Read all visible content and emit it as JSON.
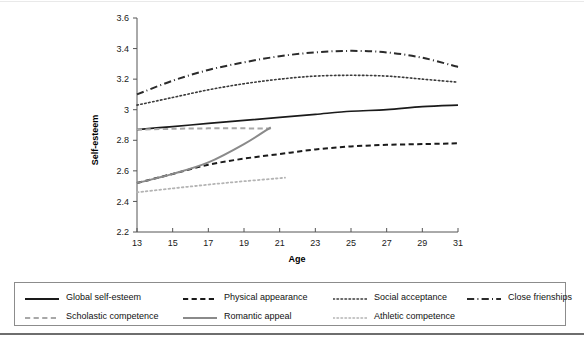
{
  "figure": {
    "has_top_rule": true,
    "has_bottom_rule": true
  },
  "chart_data": {
    "type": "line",
    "title": "",
    "xlabel": "Age",
    "ylabel": "Self-esteem",
    "xlim": [
      13,
      31
    ],
    "ylim": [
      2.2,
      3.6
    ],
    "xticks": [
      13,
      15,
      17,
      19,
      21,
      23,
      25,
      27,
      29,
      31
    ],
    "xtick_labels": [
      "13",
      "15",
      "17",
      "19",
      "21",
      "23",
      "25",
      "27",
      "29",
      "31"
    ],
    "yticks": [
      2.2,
      2.4,
      2.6,
      2.8,
      3.0,
      3.2,
      3.4,
      3.6
    ],
    "ytick_labels": [
      "2.2",
      "2.4",
      "2.6",
      "2.8",
      "3",
      "3.2",
      "3.4",
      "3.6"
    ],
    "grid": false,
    "legend_position": "below",
    "series": [
      {
        "name": "Global self-esteem",
        "style": "solid",
        "color": "#1a1a1a",
        "width": 1.7,
        "x": [
          13,
          15,
          17,
          19,
          21,
          23,
          25,
          27,
          29,
          31
        ],
        "values": [
          2.87,
          2.89,
          2.91,
          2.93,
          2.95,
          2.97,
          2.99,
          3.0,
          3.02,
          3.03
        ]
      },
      {
        "name": "Physical appearance",
        "style": "dashed",
        "color": "#1a1a1a",
        "width": 2.0,
        "x": [
          13,
          15,
          17,
          19,
          21,
          23,
          25,
          27,
          29,
          31
        ],
        "values": [
          2.52,
          2.58,
          2.64,
          2.68,
          2.71,
          2.74,
          2.76,
          2.77,
          2.775,
          2.78
        ]
      },
      {
        "name": "Social acceptance",
        "style": "dotted",
        "color": "#3a3a3a",
        "width": 1.6,
        "x": [
          13,
          15,
          17,
          19,
          21,
          23,
          25,
          27,
          29,
          31
        ],
        "values": [
          3.03,
          3.08,
          3.13,
          3.17,
          3.2,
          3.22,
          3.225,
          3.22,
          3.2,
          3.18
        ]
      },
      {
        "name": "Close frienships",
        "style": "dashdot",
        "color": "#2b2b2b",
        "width": 2.0,
        "x": [
          13,
          15,
          17,
          19,
          21,
          23,
          25,
          27,
          29,
          31
        ],
        "values": [
          3.1,
          3.19,
          3.26,
          3.31,
          3.35,
          3.375,
          3.385,
          3.375,
          3.34,
          3.28
        ]
      },
      {
        "name": "Scholastic competence",
        "style": "dashed",
        "color": "#a8a8a8",
        "width": 2.0,
        "x": [
          13,
          15,
          17,
          19,
          20.5
        ],
        "values": [
          2.87,
          2.875,
          2.878,
          2.878,
          2.877
        ]
      },
      {
        "name": "Romantic appeal",
        "style": "solid",
        "color": "#8a8a8a",
        "width": 2.0,
        "x": [
          13,
          15,
          17,
          19,
          20.5
        ],
        "values": [
          2.52,
          2.58,
          2.655,
          2.775,
          2.885
        ]
      },
      {
        "name": "Athletic competence",
        "style": "dotted",
        "color": "#b4b4b4",
        "width": 1.8,
        "x": [
          13,
          15,
          17,
          19,
          21.3
        ],
        "values": [
          2.46,
          2.485,
          2.51,
          2.532,
          2.555
        ]
      }
    ]
  },
  "legend": {
    "entries": [
      {
        "label": "Global self-esteem",
        "style": "solid",
        "color": "#1a1a1a"
      },
      {
        "label": "Physical appearance",
        "style": "dashed",
        "color": "#1a1a1a"
      },
      {
        "label": "Social acceptance",
        "style": "dotted",
        "color": "#3a3a3a"
      },
      {
        "label": "Close frienships",
        "style": "dashdot",
        "color": "#2b2b2b"
      },
      {
        "label": "Scholastic competence",
        "style": "dashed",
        "color": "#a8a8a8"
      },
      {
        "label": "Romantic appeal",
        "style": "solid",
        "color": "#8a8a8a"
      },
      {
        "label": "Athletic competence",
        "style": "dotted",
        "color": "#b4b4b4"
      }
    ]
  }
}
